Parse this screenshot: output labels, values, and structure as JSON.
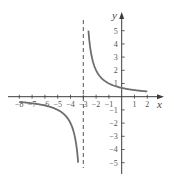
{
  "chart_data": {
    "type": "line",
    "title": "",
    "function": "y = 2/(x+3)",
    "xlabel": "x",
    "ylabel": "y",
    "xlim": [
      -8.6,
      3.2
    ],
    "ylim": [
      -5.8,
      6.3
    ],
    "grid": false,
    "legend": null,
    "x_ticks": [
      -8,
      -7,
      -6,
      -5,
      -4,
      -3,
      -2,
      -1,
      1,
      2
    ],
    "x_tick_labels": [
      "-8",
      "-7",
      "-6",
      "-5",
      "-4",
      "-3",
      "-2",
      "-1",
      "1",
      "2"
    ],
    "y_ticks": [
      5,
      4,
      3,
      2,
      1,
      -1,
      -2,
      -3,
      -4,
      -5
    ],
    "y_tick_labels": [
      "5",
      "4",
      "3",
      "2",
      "1",
      "-1",
      "-2",
      "-3",
      "-4",
      "-5"
    ],
    "annotations": [
      {
        "type": "vertical_asymptote",
        "x": -3,
        "style": "dashed"
      }
    ],
    "series": [
      {
        "name": "right-branch",
        "x": [
          -2.6,
          -2.5,
          -2.4,
          -2.2,
          -2,
          -1.5,
          -1,
          -0.5,
          0,
          0.5,
          1,
          1.5,
          2
        ],
        "y": [
          5,
          4,
          3.33,
          2.5,
          2,
          1.33,
          1,
          0.8,
          0.67,
          0.57,
          0.5,
          0.44,
          0.4
        ]
      },
      {
        "name": "left-branch",
        "x": [
          -8,
          -7,
          -6,
          -5,
          -4.5,
          -4,
          -3.8,
          -3.6,
          -3.5,
          -3.4
        ],
        "y": [
          -0.4,
          -0.5,
          -0.67,
          -1,
          -1.33,
          -2,
          -2.5,
          -3.33,
          -4,
          -5
        ]
      }
    ],
    "colors": {
      "curve": "#6e6e6e",
      "axis": "#3c3c3c",
      "asymptote": "#555555"
    }
  }
}
